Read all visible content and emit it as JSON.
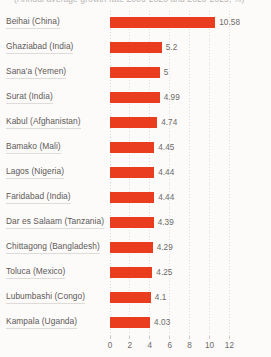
{
  "chart_data": {
    "type": "bar",
    "orientation": "horizontal",
    "title": "(Annual average growth rate 2006-2020 and 2020-2025, %)",
    "xlabel": "",
    "ylabel": "",
    "xlim": [
      0,
      12
    ],
    "xticks": [
      0,
      2,
      4,
      6,
      8,
      10,
      12
    ],
    "xtick_labels": [
      "0",
      "2",
      "4",
      "6",
      "8",
      "10",
      "12"
    ],
    "grid": true,
    "legend": "none",
    "bar_color": "#ea3c1e",
    "categories": [
      "Beihai (China)",
      "Ghaziabad (India)",
      "Sana'a (Yemen)",
      "Surat (India)",
      "Kabul (Afghanistan)",
      "Bamako (Mali)",
      "Lagos (Nigeria)",
      "Faridabad (India)",
      "Dar es Salaam (Tanzania)",
      "Chittagong (Bangladesh)",
      "Toluca (Mexico)",
      "Lubumbashi (Congo)",
      "Kampala (Uganda)"
    ],
    "values": [
      10.58,
      5.2,
      5,
      4.99,
      4.74,
      4.45,
      4.44,
      4.44,
      4.39,
      4.29,
      4.25,
      4.1,
      4.03
    ],
    "value_labels": [
      "10.58",
      "5.2",
      "5",
      "4.99",
      "4.74",
      "4.45",
      "4.44",
      "4.44",
      "4.39",
      "4.29",
      "4.25",
      "4.1",
      "4.03"
    ]
  },
  "colors": {
    "bar": "#ea3c1e",
    "background": "#fcfbfa",
    "label_text": "#5c5957",
    "value_text": "#6d6a68",
    "gridline": "#d8d6d4"
  }
}
